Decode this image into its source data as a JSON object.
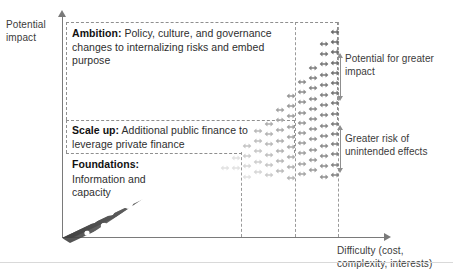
{
  "figure": {
    "axes": {
      "y_label": "Potential impact",
      "x_label": "Difficulty (cost, complexity, interests)"
    },
    "tiers": [
      {
        "id": "foundations",
        "title": "Foundations:",
        "body": "Information and capacity"
      },
      {
        "id": "scale-up",
        "title": "Scale up:",
        "body": " Additional public finance to leverage private finance"
      },
      {
        "id": "ambition",
        "title": "Ambition:",
        "body": " Policy, culture, and governance changes to internalizing risks and embed purpose"
      }
    ],
    "annotations": [
      {
        "id": "potential-impact",
        "text": "Potential for greater impact"
      },
      {
        "id": "unintended-effects",
        "text": "Greater risk of unintended effects"
      }
    ],
    "colors": {
      "axis": "#7a7a7a",
      "grid_dash": "#9a9a9a",
      "box_dash": "#8f8f8f",
      "chain_dark": "#4a4a4a",
      "chain_light": "#dcdcdc",
      "glyph_dark": "#6b6b6b",
      "glyph_light": "#e2e2e2",
      "text": "#2e2e2e",
      "background": "#ffffff"
    }
  },
  "chart_data": {
    "type": "diagram",
    "title": "",
    "xlabel": "Difficulty (cost, complexity, interests)",
    "ylabel": "Potential impact",
    "grid": true,
    "legend": "none",
    "tier_bands": [
      {
        "name": "Foundations",
        "y_fraction_range": [
          0.0,
          0.38
        ],
        "x_fraction_range": [
          0.0,
          0.55
        ]
      },
      {
        "name": "Scale up",
        "y_fraction_range": [
          0.38,
          0.53
        ],
        "x_fraction_range": [
          0.0,
          0.72
        ]
      },
      {
        "name": "Ambition",
        "y_fraction_range": [
          0.53,
          1.0
        ],
        "x_fraction_range": [
          0.0,
          0.86
        ]
      }
    ],
    "gridlines_x_fraction": [
      0.555,
      0.722,
      0.855
    ],
    "ramp_path": {
      "x_start_fraction": 0.01,
      "y_start_fraction": 0.02,
      "x_end_fraction": 0.72,
      "y_end_fraction": 0.58
    },
    "cluster_extent": {
      "x_fraction_range": [
        0.55,
        0.88
      ],
      "y_fraction_range": [
        0.36,
        0.98
      ]
    },
    "annotations": [
      {
        "text": "Potential for greater impact",
        "x_fraction": 0.9,
        "y_fraction": 0.8
      },
      {
        "text": "Greater risk of unintended effects",
        "x_fraction": 0.9,
        "y_fraction": 0.45
      }
    ]
  }
}
